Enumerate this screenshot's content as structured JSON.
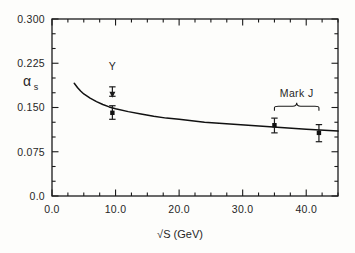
{
  "chart_data": {
    "type": "line",
    "title": "",
    "subtitle": "",
    "xlabel": "√S (GeV)",
    "ylabel": "α s",
    "ylabel_main": "α",
    "ylabel_sub": "s",
    "xlim": [
      0.0,
      45.0
    ],
    "ylim": [
      0.0,
      0.3
    ],
    "grid": false,
    "legend": "none",
    "xticks": [
      0.0,
      10.0,
      20.0,
      30.0,
      40.0
    ],
    "xticklabels": [
      "0.0",
      "10.0",
      "20.0",
      "30.0",
      "40.0"
    ],
    "xminor_step": 2.5,
    "yticks": [
      0.0,
      0.075,
      0.15,
      0.225,
      0.3
    ],
    "yticklabels": [
      "0.0",
      "0.075",
      "0.150",
      "0.225",
      "0.300"
    ],
    "yminor_step": 0.025,
    "series": [
      {
        "name": "QCD running coupling",
        "type": "line",
        "x": [
          3.5,
          4.0,
          4.5,
          5.0,
          6.0,
          7.0,
          8.0,
          9.0,
          10.0,
          12.0,
          14.0,
          16.0,
          18.0,
          20.0,
          24.0,
          28.0,
          32.0,
          36.0,
          40.0,
          45.0
        ],
        "y": [
          0.191,
          0.184,
          0.178,
          0.173,
          0.166,
          0.16,
          0.155,
          0.151,
          0.148,
          0.143,
          0.139,
          0.135,
          0.132,
          0.13,
          0.125,
          0.122,
          0.119,
          0.116,
          0.113,
          0.11
        ]
      },
      {
        "name": "Upsilon point",
        "type": "scatter",
        "points": [
          {
            "x": 9.5,
            "y": 0.179,
            "yerr_up": 0.006,
            "yerr_down": 0.01,
            "marker": "arrow-down"
          }
        ]
      },
      {
        "name": "Low energy point",
        "type": "scatter",
        "points": [
          {
            "x": 9.5,
            "y": 0.141,
            "yerr_up": 0.012,
            "yerr_down": 0.011,
            "marker": "filled-square"
          }
        ]
      },
      {
        "name": "Mark J",
        "type": "scatter",
        "points": [
          {
            "x": 35.0,
            "y": 0.12,
            "yerr_up": 0.012,
            "yerr_down": 0.013,
            "marker": "filled-square"
          },
          {
            "x": 42.0,
            "y": 0.107,
            "yerr_up": 0.014,
            "yerr_down": 0.015,
            "marker": "filled-square"
          }
        ]
      }
    ],
    "annotations": [
      {
        "name": "upsilon-label",
        "text": "Υ",
        "x": 9.5,
        "y": 0.213
      },
      {
        "name": "mark-j-label",
        "text": "Mark J",
        "x": 38.5,
        "y": 0.168
      },
      {
        "name": "mark-j-brace",
        "text": "",
        "x_start": 35.0,
        "x_end": 42.0,
        "y": 0.152
      }
    ],
    "colors": {
      "background": "#fdfdfb",
      "ink": "#1b1b1b",
      "axis": "#222222",
      "curve": "#111111",
      "marker": "#111111"
    }
  }
}
